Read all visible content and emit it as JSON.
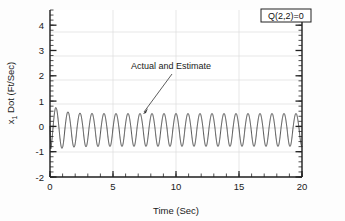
{
  "chart_data": {
    "type": "line",
    "title": "",
    "xlabel": "Time (Sec)",
    "ylabel": "x_1 Dot (Ft/Sec)",
    "ylabel_base": "x",
    "ylabel_sub": "1",
    "ylabel_rest": " Dot (Ft/Sec)",
    "xlim": [
      0,
      20
    ],
    "ylim": [
      -2,
      4.6
    ],
    "xticks": [
      0,
      5,
      10,
      15,
      20
    ],
    "xtick_labels": [
      "0",
      "5",
      "10",
      "15",
      "20"
    ],
    "yticks": [
      -2,
      -1,
      0,
      1,
      2,
      3,
      4
    ],
    "ytick_labels": [
      "-2",
      "-1",
      "0",
      "1",
      "2",
      "3",
      "4"
    ],
    "x_minor_tick_step": 1,
    "y_minor_tick_step": 0.2,
    "grid": true,
    "grid_color": "#d9d9d9",
    "line_color": "#333333",
    "line_width": 0.9,
    "legend": null,
    "series": [
      {
        "name": "Actual and Estimate",
        "description": "Oscillatory response ~1.05 Hz, initial transient peak near 1.0 at t=0.45, settling to steady amplitude about 0.60 to -0.72",
        "frequency_hz": 1.05,
        "steady_amplitude_positive": 0.58,
        "steady_amplitude_negative": -0.72,
        "initial_peak": 1.02,
        "initial_dip": -0.35,
        "mean_offset": -0.07
      }
    ],
    "annotations": [
      {
        "name": "actual-and-estimate",
        "text": "Actual and Estimate",
        "text_x": 7.2,
        "text_y": 2.25,
        "arrow_tip_x": 7.35,
        "arrow_tip_y": 0.62
      }
    ],
    "boxed_labels": [
      {
        "name": "q-matrix-label",
        "text": "Q(2,2)=0",
        "x": 18.1,
        "y": 4.35
      }
    ]
  }
}
